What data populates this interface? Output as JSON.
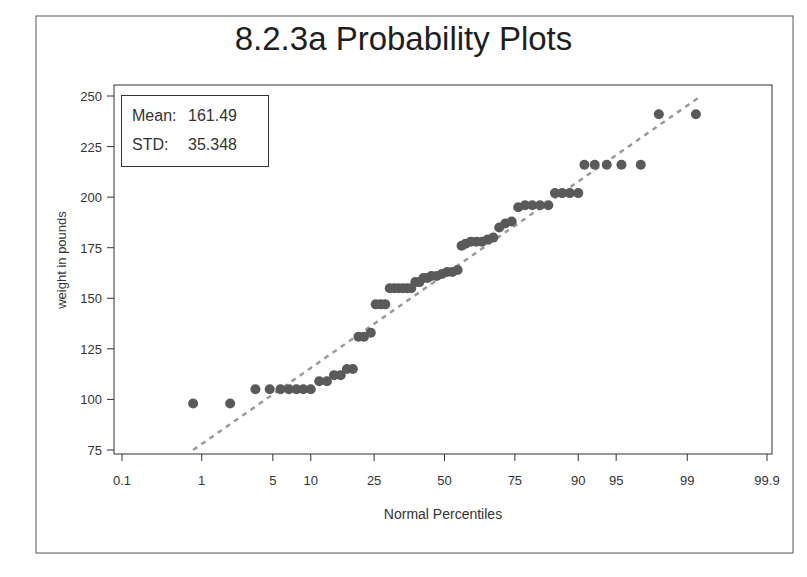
{
  "chart_data": {
    "type": "scatter",
    "title": "8.2.3a Probability Plots",
    "xlabel": "Normal Percentiles",
    "ylabel": "weight in pounds",
    "x_scale": "normal-probability",
    "x_ticks": [
      "0.1",
      "1",
      "5",
      "10",
      "25",
      "50",
      "75",
      "90",
      "95",
      "99",
      "99.9"
    ],
    "y_ticks": [
      75,
      100,
      125,
      150,
      175,
      200,
      225,
      250
    ],
    "ylim": [
      72,
      255
    ],
    "grid": false,
    "legend": null,
    "stats": {
      "mean_label": "Mean:",
      "mean_value": "161.49",
      "std_label": "STD:",
      "std_value": "35.348"
    },
    "reference_line": {
      "style": "dashed",
      "color": "#9a9a9a",
      "from_pct": 0.8,
      "to_pct": 99.3,
      "from_y": 75,
      "to_y": 250
    },
    "series": [
      {
        "name": "weight",
        "color": "#5a5a5a",
        "points": [
          [
            0.8,
            98
          ],
          [
            2.0,
            98
          ],
          [
            3.5,
            105
          ],
          [
            4.7,
            105
          ],
          [
            5.8,
            105
          ],
          [
            6.8,
            105
          ],
          [
            7.8,
            105
          ],
          [
            8.8,
            105
          ],
          [
            10.0,
            105
          ],
          [
            11.5,
            109
          ],
          [
            13.0,
            109
          ],
          [
            14.5,
            112
          ],
          [
            16.0,
            112
          ],
          [
            17.5,
            115
          ],
          [
            19.0,
            115
          ],
          [
            20.5,
            131
          ],
          [
            22.0,
            131
          ],
          [
            24.0,
            133
          ],
          [
            25.5,
            147
          ],
          [
            27.0,
            147
          ],
          [
            28.5,
            147
          ],
          [
            30.0,
            155
          ],
          [
            31.5,
            155
          ],
          [
            33.0,
            155
          ],
          [
            34.5,
            155
          ],
          [
            36.0,
            155
          ],
          [
            37.5,
            155
          ],
          [
            39.0,
            158
          ],
          [
            40.5,
            158
          ],
          [
            42.0,
            160
          ],
          [
            43.5,
            160
          ],
          [
            45.0,
            161
          ],
          [
            47.0,
            161
          ],
          [
            49.0,
            162
          ],
          [
            51.0,
            163
          ],
          [
            53.0,
            163
          ],
          [
            55.0,
            164
          ],
          [
            56.5,
            176
          ],
          [
            58.0,
            177
          ],
          [
            60.0,
            178
          ],
          [
            62.0,
            178
          ],
          [
            64.0,
            178
          ],
          [
            66.0,
            179
          ],
          [
            68.0,
            180
          ],
          [
            70.0,
            185
          ],
          [
            72.0,
            187
          ],
          [
            74.0,
            188
          ],
          [
            76.0,
            195
          ],
          [
            78.0,
            196
          ],
          [
            80.0,
            196
          ],
          [
            82.0,
            196
          ],
          [
            84.0,
            196
          ],
          [
            85.5,
            202
          ],
          [
            87.0,
            202
          ],
          [
            88.5,
            202
          ],
          [
            90.0,
            202
          ],
          [
            91.0,
            216
          ],
          [
            92.5,
            216
          ],
          [
            94.0,
            216
          ],
          [
            95.5,
            216
          ],
          [
            97.0,
            216
          ],
          [
            98.0,
            241
          ],
          [
            99.2,
            241
          ]
        ]
      }
    ]
  }
}
